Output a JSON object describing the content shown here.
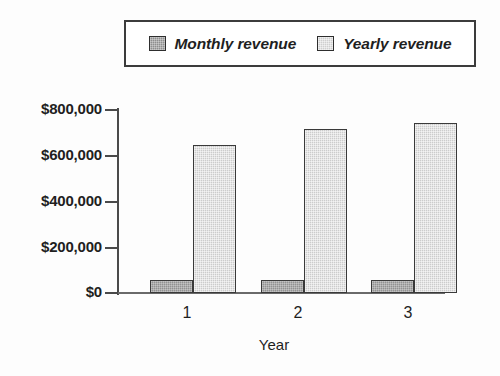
{
  "legend": {
    "entries": [
      {
        "label": "Monthly revenue",
        "swatch": "dark-gray-dither",
        "color": "#8e8e8e"
      },
      {
        "label": "Yearly revenue",
        "swatch": "light-gray-dither",
        "color": "#cfcfcf"
      }
    ]
  },
  "axes": {
    "y_ticks": [
      "$800,000",
      "$600,000",
      "$400,000",
      "$200,000",
      "$0"
    ],
    "x_ticks": [
      "1",
      "2",
      "3"
    ],
    "x_title": "Year",
    "y_title": ""
  },
  "chart_data": {
    "type": "bar",
    "title": "",
    "xlabel": "Year",
    "ylabel": "",
    "categories": [
      "1",
      "2",
      "3"
    ],
    "series": [
      {
        "name": "Monthly revenue",
        "values": [
          55000,
          55000,
          55000
        ],
        "color": "#8e8e8e"
      },
      {
        "name": "Yearly revenue",
        "values": [
          645000,
          712000,
          740000
        ],
        "color": "#cfcfcf"
      }
    ],
    "ylim": [
      0,
      800000
    ],
    "ytick_values": [
      800000,
      600000,
      400000,
      200000,
      0
    ],
    "ytick_labels": [
      "$800,000",
      "$600,000",
      "$400,000",
      "$200,000",
      "$0"
    ],
    "grid": false,
    "legend_position": "top",
    "currency": "USD"
  },
  "colors": {
    "axis": "#4a4a4a",
    "bar_border": "#3a3a3a",
    "text": "#1f1f1f",
    "background": "#ffffff"
  }
}
